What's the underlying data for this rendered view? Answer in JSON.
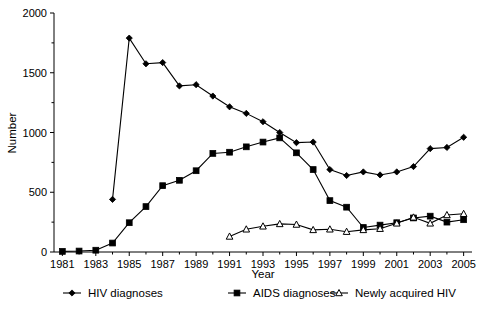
{
  "chart_data": {
    "type": "line",
    "title": "",
    "xlabel": "Year",
    "ylabel": "Number",
    "xlim": [
      1980.5,
      2005.5
    ],
    "ylim": [
      0,
      2000
    ],
    "grid": false,
    "legend_position": "bottom",
    "x_tick_labels": [
      "1981",
      "1983",
      "1985",
      "1987",
      "1989",
      "1991",
      "1993",
      "1995",
      "1997",
      "1999",
      "2001",
      "2003",
      "2005"
    ],
    "y_tick_labels": [
      "0",
      "500",
      "1000",
      "1500",
      "2000"
    ],
    "y_ticks": [
      0,
      500,
      1000,
      1500,
      2000
    ],
    "y_minor_ticks": [
      250,
      750,
      1250,
      1750
    ],
    "x": [
      1981,
      1982,
      1983,
      1984,
      1985,
      1986,
      1987,
      1988,
      1989,
      1990,
      1991,
      1992,
      1993,
      1994,
      1995,
      1996,
      1997,
      1998,
      1999,
      2000,
      2001,
      2002,
      2003,
      2004,
      2005
    ],
    "series": [
      {
        "name": "HIV diagnoses",
        "marker": "filled-diamond",
        "x": [
          1984,
          1985,
          1986,
          1987,
          1988,
          1989,
          1990,
          1991,
          1992,
          1993,
          1994,
          1995,
          1996,
          1997,
          1998,
          1999,
          2000,
          2001,
          2002,
          2003,
          2004,
          2005
        ],
        "values": [
          440,
          1790,
          1575,
          1585,
          1390,
          1400,
          1305,
          1215,
          1160,
          1090,
          1000,
          915,
          920,
          690,
          640,
          670,
          645,
          670,
          715,
          865,
          875,
          960
        ]
      },
      {
        "name": "AIDS diagnoses",
        "marker": "filled-square",
        "x": [
          1981,
          1982,
          1983,
          1984,
          1985,
          1986,
          1987,
          1988,
          1989,
          1990,
          1991,
          1992,
          1993,
          1994,
          1995,
          1996,
          1997,
          1998,
          1999,
          2000,
          2001,
          2002,
          2003,
          2004,
          2005
        ],
        "values": [
          5,
          8,
          15,
          75,
          245,
          380,
          555,
          600,
          680,
          825,
          835,
          880,
          920,
          955,
          830,
          690,
          430,
          375,
          205,
          225,
          245,
          285,
          300,
          250,
          270
        ]
      },
      {
        "name": "Newly acquired HIV",
        "marker": "open-triangle",
        "x": [
          1991,
          1992,
          1993,
          1994,
          1995,
          1996,
          1997,
          1998,
          1999,
          2000,
          2001,
          2002,
          2003,
          2004,
          2005
        ],
        "values": [
          130,
          190,
          215,
          235,
          230,
          185,
          190,
          170,
          185,
          195,
          240,
          290,
          240,
          310,
          320
        ]
      }
    ]
  },
  "legend": {
    "items": [
      {
        "label": "HIV diagnoses",
        "marker": "filled-diamond"
      },
      {
        "label": "AIDS diagnoses",
        "marker": "filled-square"
      },
      {
        "label": "Newly acquired HIV",
        "marker": "open-triangle"
      }
    ]
  }
}
